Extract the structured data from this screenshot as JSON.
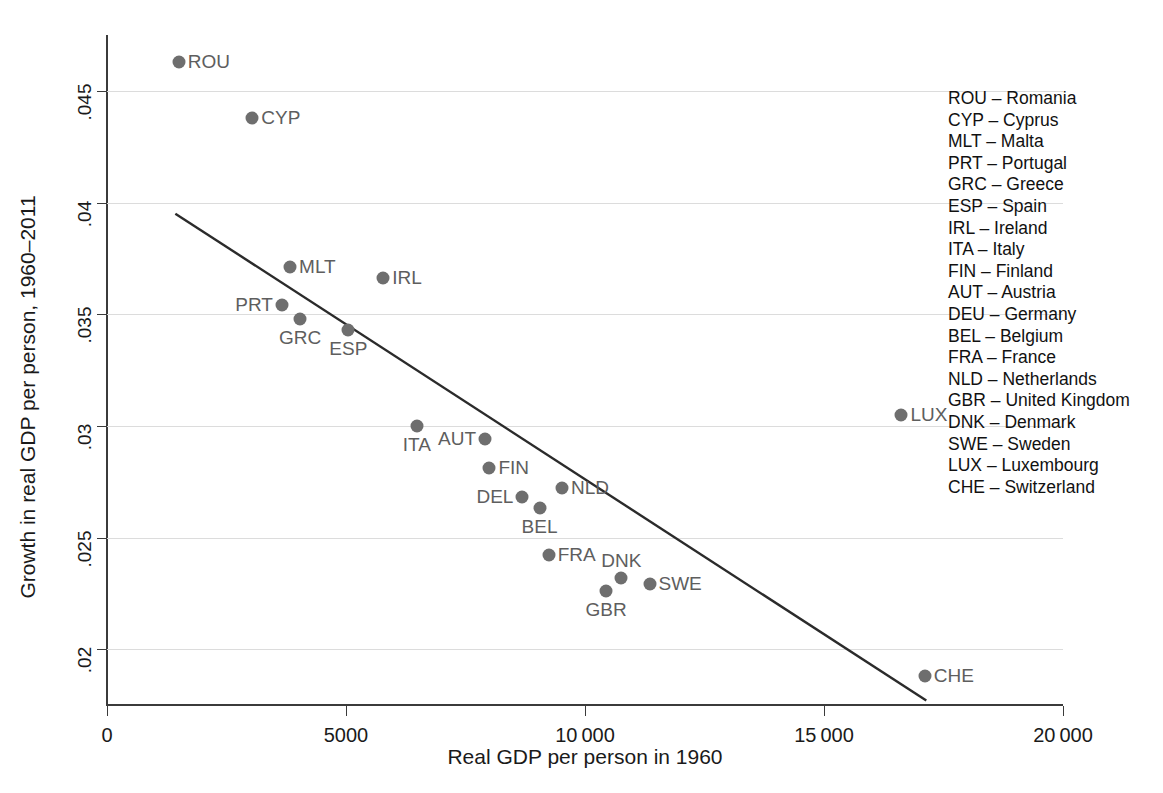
{
  "chart_data": {
    "type": "scatter",
    "title": "",
    "xlabel": "Real GDP per person in 1960",
    "ylabel": "Growth in real GDP per person, 1960–2011",
    "xlim": [
      0,
      20000
    ],
    "ylim": [
      0.0175,
      0.0475
    ],
    "xticks": [
      0,
      5000,
      10000,
      15000,
      20000
    ],
    "xtick_labels": [
      "0",
      "5000",
      "10 000",
      "15 000",
      "20 000"
    ],
    "yticks": [
      0.02,
      0.025,
      0.03,
      0.035,
      0.04,
      0.045
    ],
    "ytick_labels": [
      ".02",
      ".025",
      ".03",
      ".035",
      ".04",
      ".045"
    ],
    "grid": "horizontal",
    "legend_position": "right-outside",
    "marker_color": "#6e6e6e",
    "label_color": "#5e5e5e",
    "gridline_color": "#dcdcdc",
    "axis_color": "#3b3b3b",
    "points": [
      {
        "code": "ROU",
        "x": 1500,
        "y": 0.0463,
        "label_pos": "right"
      },
      {
        "code": "CYP",
        "x": 3040,
        "y": 0.0438,
        "label_pos": "right"
      },
      {
        "code": "MLT",
        "x": 3830,
        "y": 0.0371,
        "label_pos": "right"
      },
      {
        "code": "IRL",
        "x": 5780,
        "y": 0.0366,
        "label_pos": "right"
      },
      {
        "code": "PRT",
        "x": 3660,
        "y": 0.0354,
        "label_pos": "left"
      },
      {
        "code": "GRC",
        "x": 4040,
        "y": 0.0348,
        "label_pos": "below"
      },
      {
        "code": "ESP",
        "x": 5050,
        "y": 0.0343,
        "label_pos": "below"
      },
      {
        "code": "ITA",
        "x": 6480,
        "y": 0.03,
        "label_pos": "below"
      },
      {
        "code": "AUT",
        "x": 7910,
        "y": 0.0294,
        "label_pos": "left"
      },
      {
        "code": "FIN",
        "x": 8000,
        "y": 0.0281,
        "label_pos": "right"
      },
      {
        "code": "NLD",
        "x": 9520,
        "y": 0.0272,
        "label_pos": "right"
      },
      {
        "code": "DEL",
        "x": 8690,
        "y": 0.0268,
        "label_pos": "left"
      },
      {
        "code": "BEL",
        "x": 9050,
        "y": 0.0263,
        "label_pos": "below"
      },
      {
        "code": "FRA",
        "x": 9240,
        "y": 0.0242,
        "label_pos": "right"
      },
      {
        "code": "DNK",
        "x": 10760,
        "y": 0.0232,
        "label_pos": "above"
      },
      {
        "code": "SWE",
        "x": 11350,
        "y": 0.0229,
        "label_pos": "right"
      },
      {
        "code": "GBR",
        "x": 10440,
        "y": 0.0226,
        "label_pos": "below"
      },
      {
        "code": "LUX",
        "x": 16620,
        "y": 0.0305,
        "label_pos": "right"
      },
      {
        "code": "CHE",
        "x": 17110,
        "y": 0.0188,
        "label_pos": "right"
      }
    ],
    "fit_line": {
      "x0": 1430,
      "y0": 0.0395,
      "x1": 17140,
      "y1": 0.0177
    }
  },
  "legend": {
    "entries": [
      {
        "code": "ROU",
        "dash": "–",
        "country": "Romania"
      },
      {
        "code": "CYP",
        "dash": "–",
        "country": "Cyprus"
      },
      {
        "code": "MLT",
        "dash": "–",
        "country": "Malta"
      },
      {
        "code": "PRT",
        "dash": "–",
        "country": "Portugal"
      },
      {
        "code": "GRC",
        "dash": "–",
        "country": "Greece"
      },
      {
        "code": "ESP",
        "dash": "–",
        "country": "Spain"
      },
      {
        "code": "IRL",
        "dash": "–",
        "country": "Ireland"
      },
      {
        "code": "ITA",
        "dash": "–",
        "country": "Italy"
      },
      {
        "code": "FIN",
        "dash": "–",
        "country": "Finland"
      },
      {
        "code": "AUT",
        "dash": "–",
        "country": "Austria"
      },
      {
        "code": "DEU",
        "dash": "–",
        "country": "Germany"
      },
      {
        "code": "BEL",
        "dash": "–",
        "country": "Belgium"
      },
      {
        "code": "FRA",
        "dash": "–",
        "country": "France"
      },
      {
        "code": "NLD",
        "dash": "–",
        "country": "Netherlands"
      },
      {
        "code": "GBR",
        "dash": "–",
        "country": "United Kingdom"
      },
      {
        "code": "DNK",
        "dash": "–",
        "country": "Denmark"
      },
      {
        "code": "SWE",
        "dash": "–",
        "country": "Sweden"
      },
      {
        "code": "LUX",
        "dash": "–",
        "country": "Luxembourg"
      },
      {
        "code": "CHE",
        "dash": "–",
        "country": "Switzerland"
      }
    ]
  }
}
